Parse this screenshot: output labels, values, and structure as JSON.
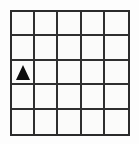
{
  "figure": {
    "kind": "grid-diagram",
    "background_color": "#fdfdfd",
    "grid": {
      "rows": 5,
      "columns": 5,
      "line_color": "#2f2f2f",
      "border_color": "#2b2b2b",
      "cell_fill": "#fbfbfa",
      "line_width_px": 2,
      "row_labels": [
        "1",
        "2",
        "3",
        "4",
        "5"
      ],
      "column_labels": [
        "1",
        "2",
        "3",
        "4",
        "5"
      ]
    },
    "markers": [
      {
        "name": "triangle-marker",
        "glyph": "triangle-up-icon",
        "symbol": "▲",
        "color": "#0d0d0d",
        "row": 3,
        "column": 1
      }
    ],
    "cells": [
      [
        {
          "row": 1,
          "column": 1,
          "marker": null
        },
        {
          "row": 1,
          "column": 2,
          "marker": null
        },
        {
          "row": 1,
          "column": 3,
          "marker": null
        },
        {
          "row": 1,
          "column": 4,
          "marker": null
        },
        {
          "row": 1,
          "column": 5,
          "marker": null
        }
      ],
      [
        {
          "row": 2,
          "column": 1,
          "marker": null
        },
        {
          "row": 2,
          "column": 2,
          "marker": null
        },
        {
          "row": 2,
          "column": 3,
          "marker": null
        },
        {
          "row": 2,
          "column": 4,
          "marker": null
        },
        {
          "row": 2,
          "column": 5,
          "marker": null
        }
      ],
      [
        {
          "row": 3,
          "column": 1,
          "marker": "triangle-up-icon"
        },
        {
          "row": 3,
          "column": 2,
          "marker": null
        },
        {
          "row": 3,
          "column": 3,
          "marker": null
        },
        {
          "row": 3,
          "column": 4,
          "marker": null
        },
        {
          "row": 3,
          "column": 5,
          "marker": null
        }
      ],
      [
        {
          "row": 4,
          "column": 1,
          "marker": null
        },
        {
          "row": 4,
          "column": 2,
          "marker": null
        },
        {
          "row": 4,
          "column": 3,
          "marker": null
        },
        {
          "row": 4,
          "column": 4,
          "marker": null
        },
        {
          "row": 4,
          "column": 5,
          "marker": null
        }
      ],
      [
        {
          "row": 5,
          "column": 1,
          "marker": null
        },
        {
          "row": 5,
          "column": 2,
          "marker": null
        },
        {
          "row": 5,
          "column": 3,
          "marker": null
        },
        {
          "row": 5,
          "column": 4,
          "marker": null
        },
        {
          "row": 5,
          "column": 5,
          "marker": null
        }
      ]
    ]
  }
}
